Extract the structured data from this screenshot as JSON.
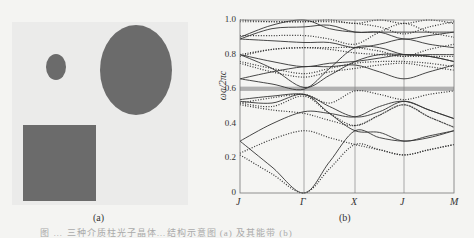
{
  "figure": {
    "panel_a": {
      "label": "(a)",
      "background_color": "#ebebea",
      "shape_color": "#6b6b6b",
      "shapes": [
        {
          "type": "ellipse",
          "name": "small-circle",
          "cx": 56,
          "cy": 67,
          "rx": 10,
          "ry": 13
        },
        {
          "type": "ellipse",
          "name": "large-ellipse",
          "cx": 136,
          "cy": 70,
          "rx": 36,
          "ry": 45
        },
        {
          "type": "rect",
          "name": "square",
          "x": 23,
          "y": 125,
          "w": 73,
          "h": 76
        }
      ]
    },
    "panel_b": {
      "label": "(b)"
    },
    "caption": "图 … 三种介质柱光子晶体…结构示意图 (a) 及其能带 (b)"
  },
  "chart_data": {
    "type": "line",
    "title": "",
    "xlabel": "",
    "ylabel": "ωa/2πc",
    "x_ticks": [
      "J",
      "Γ",
      "X",
      "J",
      "M"
    ],
    "x_positions": [
      0,
      1,
      2,
      3,
      4
    ],
    "y_ticks": [
      "0",
      "0.2",
      "0.4",
      "0.6",
      "0.8",
      "1.0"
    ],
    "ylim": [
      0,
      1.0
    ],
    "grid": "vertical lines at high-symmetry points",
    "band_gap": {
      "from": 0.59,
      "to": 0.615,
      "color": "#b0b0b0"
    },
    "series": [
      {
        "name": "solid bands (mode 1)",
        "style": "solid",
        "bands": [
          [
            [
              0,
              0.3
            ],
            [
              0.5,
              0.15
            ],
            [
              1,
              0.0
            ],
            [
              1.5,
              0.18
            ],
            [
              2,
              0.36
            ],
            [
              2.5,
              0.32
            ],
            [
              3,
              0.3
            ],
            [
              3.5,
              0.32
            ],
            [
              4,
              0.36
            ]
          ],
          [
            [
              0,
              0.3
            ],
            [
              0.5,
              0.4
            ],
            [
              1,
              0.47
            ],
            [
              1.5,
              0.46
            ],
            [
              2,
              0.44
            ],
            [
              2.5,
              0.5
            ],
            [
              3,
              0.53
            ],
            [
              3.5,
              0.48
            ],
            [
              4,
              0.43
            ]
          ],
          [
            [
              0,
              0.53
            ],
            [
              0.5,
              0.52
            ],
            [
              1,
              0.57
            ],
            [
              1.5,
              0.46
            ],
            [
              2,
              0.36
            ],
            [
              2.5,
              0.35
            ],
            [
              3,
              0.3
            ],
            [
              3.5,
              0.33
            ],
            [
              4,
              0.36
            ]
          ],
          [
            [
              0,
              0.54
            ],
            [
              0.5,
              0.56
            ],
            [
              1,
              0.57
            ],
            [
              1.5,
              0.5
            ],
            [
              2,
              0.44
            ],
            [
              2.5,
              0.47
            ],
            [
              3,
              0.53
            ],
            [
              3.5,
              0.48
            ],
            [
              4,
              0.43
            ]
          ],
          [
            [
              0,
              0.66
            ],
            [
              0.5,
              0.63
            ],
            [
              1,
              0.6
            ],
            [
              1.5,
              0.72
            ],
            [
              2,
              0.84
            ],
            [
              2.5,
              0.84
            ],
            [
              3,
              0.8
            ],
            [
              3.5,
              0.8
            ],
            [
              4,
              0.8
            ]
          ],
          [
            [
              0,
              0.66
            ],
            [
              0.5,
              0.7
            ],
            [
              1,
              0.73
            ],
            [
              1.5,
              0.73
            ],
            [
              2,
              0.74
            ],
            [
              2.5,
              0.7
            ],
            [
              3,
              0.66
            ],
            [
              3.5,
              0.7
            ],
            [
              4,
              0.74
            ]
          ],
          [
            [
              0,
              0.8
            ],
            [
              0.5,
              0.72
            ],
            [
              1,
              0.61
            ],
            [
              1.5,
              0.68
            ],
            [
              2,
              0.76
            ],
            [
              2.5,
              0.8
            ],
            [
              3,
              0.8
            ],
            [
              3.5,
              0.79
            ],
            [
              4,
              0.76
            ]
          ],
          [
            [
              0,
              0.8
            ],
            [
              0.5,
              0.76
            ],
            [
              1,
              0.73
            ],
            [
              1.5,
              0.75
            ],
            [
              2,
              0.76
            ],
            [
              2.5,
              0.78
            ],
            [
              3,
              0.8
            ],
            [
              3.5,
              0.79
            ],
            [
              4,
              0.76
            ]
          ],
          [
            [
              0,
              0.89
            ],
            [
              0.5,
              0.88
            ],
            [
              1,
              0.87
            ],
            [
              1.5,
              0.87
            ],
            [
              2,
              0.84
            ],
            [
              2.5,
              0.86
            ],
            [
              3,
              0.89
            ],
            [
              3.5,
              0.86
            ],
            [
              4,
              0.84
            ]
          ],
          [
            [
              0,
              0.89
            ],
            [
              0.5,
              0.95
            ],
            [
              1,
              0.96
            ],
            [
              1.5,
              0.97
            ],
            [
              2,
              0.93
            ],
            [
              2.5,
              0.93
            ],
            [
              3,
              0.89
            ],
            [
              3.5,
              0.91
            ],
            [
              4,
              0.93
            ]
          ],
          [
            [
              0,
              0.9
            ],
            [
              0.5,
              0.97
            ],
            [
              1,
              1.0
            ],
            [
              1.5,
              0.95
            ],
            [
              2,
              0.93
            ],
            [
              2.5,
              0.93
            ],
            [
              3,
              0.93
            ],
            [
              3.5,
              0.93
            ],
            [
              4,
              0.93
            ]
          ]
        ]
      },
      {
        "name": "dotted bands (mode 2)",
        "style": "dotted",
        "bands": [
          [
            [
              0,
              0.22
            ],
            [
              0.5,
              0.11
            ],
            [
              1,
              0.0
            ],
            [
              1.5,
              0.14
            ],
            [
              2,
              0.28
            ],
            [
              2.5,
              0.25
            ],
            [
              3,
              0.22
            ],
            [
              3.5,
              0.25
            ],
            [
              4,
              0.28
            ]
          ],
          [
            [
              0,
              0.23
            ],
            [
              0.5,
              0.31
            ],
            [
              1,
              0.36
            ],
            [
              1.5,
              0.32
            ],
            [
              2,
              0.28
            ],
            [
              2.5,
              0.25
            ],
            [
              3,
              0.22
            ],
            [
              3.5,
              0.25
            ],
            [
              4,
              0.28
            ]
          ],
          [
            [
              0,
              0.51
            ],
            [
              0.5,
              0.48
            ],
            [
              1,
              0.46
            ],
            [
              1.5,
              0.42
            ],
            [
              2,
              0.39
            ],
            [
              2.5,
              0.45
            ],
            [
              3,
              0.51
            ],
            [
              3.5,
              0.44
            ],
            [
              4,
              0.38
            ]
          ],
          [
            [
              0,
              0.52
            ],
            [
              0.5,
              0.5
            ],
            [
              1,
              0.56
            ],
            [
              1.5,
              0.46
            ],
            [
              2,
              0.39
            ],
            [
              2.5,
              0.45
            ],
            [
              3,
              0.51
            ],
            [
              3.5,
              0.44
            ],
            [
              4,
              0.38
            ]
          ],
          [
            [
              0,
              0.52
            ],
            [
              0.5,
              0.55
            ],
            [
              1,
              0.57
            ],
            [
              1.5,
              0.52
            ],
            [
              2,
              0.59
            ],
            [
              2.5,
              0.57
            ],
            [
              3,
              0.54
            ],
            [
              3.5,
              0.57
            ],
            [
              4,
              0.59
            ]
          ],
          [
            [
              0,
              0.75
            ],
            [
              0.5,
              0.7
            ],
            [
              1,
              0.67
            ],
            [
              1.5,
              0.7
            ],
            [
              2,
              0.72
            ],
            [
              2.5,
              0.74
            ],
            [
              3,
              0.75
            ],
            [
              3.5,
              0.73
            ],
            [
              4,
              0.71
            ]
          ],
          [
            [
              0,
              0.76
            ],
            [
              0.5,
              0.72
            ],
            [
              1,
              0.69
            ],
            [
              1.5,
              0.72
            ],
            [
              2,
              0.75
            ],
            [
              2.5,
              0.76
            ],
            [
              3,
              0.76
            ],
            [
              3.5,
              0.75
            ],
            [
              4,
              0.73
            ]
          ],
          [
            [
              0,
              0.79
            ],
            [
              0.5,
              0.83
            ],
            [
              1,
              0.84
            ],
            [
              1.5,
              0.83
            ],
            [
              2,
              0.81
            ],
            [
              2.5,
              0.8
            ],
            [
              3,
              0.79
            ],
            [
              3.5,
              0.79
            ],
            [
              4,
              0.79
            ]
          ],
          [
            [
              0,
              0.8
            ],
            [
              0.5,
              0.83
            ],
            [
              1,
              0.84
            ],
            [
              1.5,
              0.84
            ],
            [
              2,
              0.84
            ],
            [
              2.5,
              0.82
            ],
            [
              3,
              0.79
            ],
            [
              3.5,
              0.83
            ],
            [
              4,
              0.86
            ]
          ],
          [
            [
              0,
              0.91
            ],
            [
              0.5,
              0.91
            ],
            [
              1,
              0.91
            ],
            [
              1.5,
              0.89
            ],
            [
              2,
              0.86
            ],
            [
              2.5,
              0.93
            ],
            [
              3,
              0.98
            ],
            [
              3.5,
              0.93
            ],
            [
              4,
              0.9
            ]
          ],
          [
            [
              0,
              0.99
            ],
            [
              0.5,
              0.99
            ],
            [
              1,
              0.99
            ],
            [
              1.5,
              0.99
            ],
            [
              2,
              0.98
            ],
            [
              2.5,
              0.96
            ],
            [
              3,
              0.92
            ],
            [
              3.5,
              0.96
            ],
            [
              4,
              0.99
            ]
          ],
          [
            [
              0,
              1.0
            ],
            [
              0.5,
              0.99
            ],
            [
              1,
              0.99
            ],
            [
              1.5,
              1.0
            ],
            [
              2,
              0.98
            ],
            [
              2.5,
              1.0
            ],
            [
              3,
              0.98
            ],
            [
              3.5,
              1.0
            ],
            [
              4,
              0.98
            ]
          ]
        ]
      }
    ]
  }
}
